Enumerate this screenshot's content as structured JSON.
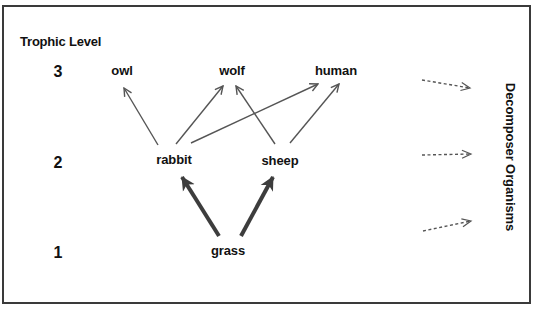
{
  "diagram": {
    "type": "food-web",
    "axis_title": "Trophic Level",
    "levels": [
      {
        "number": "3",
        "organisms": [
          "owl",
          "wolf",
          "human"
        ]
      },
      {
        "number": "2",
        "organisms": [
          "rabbit",
          "sheep"
        ]
      },
      {
        "number": "1",
        "organisms": [
          "grass"
        ]
      }
    ],
    "labels": {
      "level3": "3",
      "level2": "2",
      "level1": "1",
      "owl": "owl",
      "wolf": "wolf",
      "human": "human",
      "rabbit": "rabbit",
      "sheep": "sheep",
      "grass": "grass",
      "decomposer": "Decomposer Organisms"
    },
    "edges": [
      {
        "from": "grass",
        "to": "rabbit",
        "style": "thick"
      },
      {
        "from": "grass",
        "to": "sheep",
        "style": "thick"
      },
      {
        "from": "rabbit",
        "to": "owl",
        "style": "thin"
      },
      {
        "from": "rabbit",
        "to": "wolf",
        "style": "thin"
      },
      {
        "from": "rabbit",
        "to": "human",
        "style": "thin"
      },
      {
        "from": "sheep",
        "to": "wolf",
        "style": "thin"
      },
      {
        "from": "sheep",
        "to": "human",
        "style": "thin"
      },
      {
        "from": "trophic-level-3",
        "to": "Decomposer Organisms",
        "style": "dashed"
      },
      {
        "from": "trophic-level-2",
        "to": "Decomposer Organisms",
        "style": "dashed"
      },
      {
        "from": "trophic-level-1",
        "to": "Decomposer Organisms",
        "style": "dashed"
      }
    ],
    "colors": {
      "arrow_thin": "#555555",
      "arrow_thick": "#3d3d3d",
      "arrow_dashed": "#555555",
      "frame": "#3a3a3a",
      "text": "#111111"
    }
  }
}
